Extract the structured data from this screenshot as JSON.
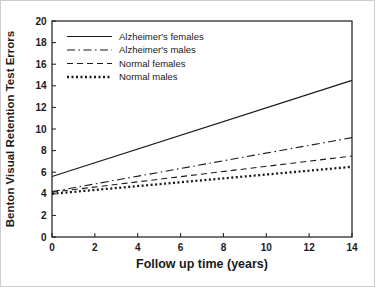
{
  "figure": {
    "background": "#ffffff",
    "border_color": "#cccccc",
    "ink_color": "#1a1a1a"
  },
  "chart_data": {
    "type": "line",
    "title": "",
    "xlabel": "Follow up time (years)",
    "ylabel": "Benton Visual Retention Test Errors",
    "xlim": [
      0,
      14
    ],
    "ylim": [
      0,
      20
    ],
    "x_ticks": [
      0,
      2,
      4,
      6,
      8,
      10,
      12,
      14
    ],
    "y_ticks": [
      0,
      2,
      4,
      6,
      8,
      10,
      12,
      14,
      16,
      18,
      20
    ],
    "grid": false,
    "legend_position": "top-left-inside",
    "series": [
      {
        "name": "Alzheimer's females",
        "style": "solid",
        "x": [
          0,
          14
        ],
        "values": [
          5.6,
          14.5
        ]
      },
      {
        "name": "Alzheimer's males",
        "style": "dash-dot",
        "x": [
          0,
          14
        ],
        "values": [
          4.2,
          9.2
        ]
      },
      {
        "name": "Normal females",
        "style": "dashed",
        "x": [
          0,
          14
        ],
        "values": [
          4.15,
          7.5
        ]
      },
      {
        "name": "Normal males",
        "style": "dotted",
        "x": [
          0,
          14
        ],
        "values": [
          4.0,
          6.5
        ]
      }
    ]
  }
}
